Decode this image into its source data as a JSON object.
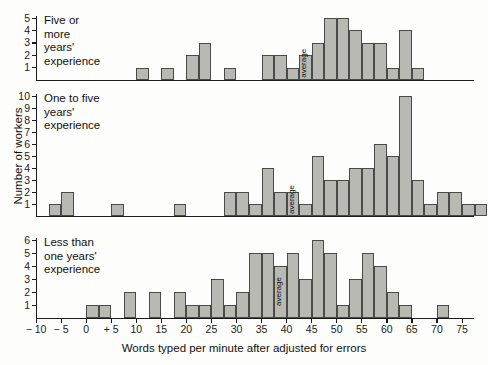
{
  "chart_data": {
    "type": "bar",
    "title": "",
    "xlabel": "Words typed per minute after adjusted for errors",
    "ylabel": "Number of workers",
    "xlim": [
      -10,
      77.5
    ],
    "bin_width": 2.5,
    "xticks": [
      -10,
      -5,
      0,
      5,
      10,
      15,
      20,
      25,
      30,
      35,
      40,
      45,
      50,
      55,
      60,
      65,
      70,
      75
    ],
    "xtick_labels": [
      "− 10",
      "− 5",
      "0",
      "+ 5",
      "10",
      "15",
      "20",
      "25",
      "30",
      "35",
      "40",
      "45",
      "50",
      "55",
      "60",
      "65",
      "70",
      "75"
    ],
    "grid": false,
    "legend": "none",
    "panels": [
      {
        "name": "five-or-more-years",
        "title": "Five or more years' experience",
        "ylim": [
          0,
          5
        ],
        "yticks": [
          1,
          2,
          3,
          4,
          5
        ],
        "average_label": "average",
        "average_bin_start": 42.5,
        "bins": [
          {
            "x0": 10.0,
            "value": 1
          },
          {
            "x0": 15.0,
            "value": 1
          },
          {
            "x0": 20.0,
            "value": 2
          },
          {
            "x0": 22.5,
            "value": 3
          },
          {
            "x0": 27.5,
            "value": 1
          },
          {
            "x0": 35.0,
            "value": 2
          },
          {
            "x0": 37.5,
            "value": 2
          },
          {
            "x0": 40.0,
            "value": 1
          },
          {
            "x0": 42.5,
            "value": 2
          },
          {
            "x0": 45.0,
            "value": 3
          },
          {
            "x0": 47.5,
            "value": 5
          },
          {
            "x0": 50.0,
            "value": 5
          },
          {
            "x0": 52.5,
            "value": 4
          },
          {
            "x0": 55.0,
            "value": 3
          },
          {
            "x0": 57.5,
            "value": 3
          },
          {
            "x0": 60.0,
            "value": 1
          },
          {
            "x0": 62.5,
            "value": 4
          },
          {
            "x0": 65.0,
            "value": 1
          }
        ]
      },
      {
        "name": "one-to-five-years",
        "title": "One to five years' experience",
        "ylim": [
          0,
          10
        ],
        "yticks": [
          1,
          2,
          3,
          4,
          5,
          6,
          7,
          8,
          9,
          10
        ],
        "average_label": "average",
        "average_bin_start": 40.0,
        "bins": [
          {
            "x0": -7.5,
            "value": 1
          },
          {
            "x0": -5.0,
            "value": 2
          },
          {
            "x0": 5.0,
            "value": 1
          },
          {
            "x0": 17.5,
            "value": 1
          },
          {
            "x0": 27.5,
            "value": 2
          },
          {
            "x0": 30.0,
            "value": 2
          },
          {
            "x0": 32.5,
            "value": 1
          },
          {
            "x0": 35.0,
            "value": 4
          },
          {
            "x0": 37.5,
            "value": 2
          },
          {
            "x0": 40.0,
            "value": 2
          },
          {
            "x0": 42.5,
            "value": 1
          },
          {
            "x0": 45.0,
            "value": 5
          },
          {
            "x0": 47.5,
            "value": 3
          },
          {
            "x0": 50.0,
            "value": 3
          },
          {
            "x0": 52.5,
            "value": 4
          },
          {
            "x0": 55.0,
            "value": 4
          },
          {
            "x0": 57.5,
            "value": 6
          },
          {
            "x0": 60.0,
            "value": 5
          },
          {
            "x0": 62.5,
            "value": 10
          },
          {
            "x0": 65.0,
            "value": 3
          },
          {
            "x0": 67.5,
            "value": 1
          },
          {
            "x0": 70.0,
            "value": 2
          },
          {
            "x0": 72.5,
            "value": 2
          },
          {
            "x0": 75.0,
            "value": 1
          },
          {
            "x0": 77.5,
            "value": 1
          },
          {
            "x0": 82.5,
            "value": 1
          }
        ]
      },
      {
        "name": "less-than-one-year",
        "title": "Less than one years'\n    experience",
        "ylim": [
          0,
          6
        ],
        "yticks": [
          1,
          2,
          3,
          4,
          5,
          6
        ],
        "average_label": "average",
        "average_bin_start": 37.5,
        "bins": [
          {
            "x0": 0.0,
            "value": 1
          },
          {
            "x0": 2.5,
            "value": 1
          },
          {
            "x0": 7.5,
            "value": 2
          },
          {
            "x0": 12.5,
            "value": 2
          },
          {
            "x0": 17.5,
            "value": 2
          },
          {
            "x0": 20.0,
            "value": 1
          },
          {
            "x0": 22.5,
            "value": 1
          },
          {
            "x0": 25.0,
            "value": 3
          },
          {
            "x0": 27.5,
            "value": 1
          },
          {
            "x0": 30.0,
            "value": 2
          },
          {
            "x0": 32.5,
            "value": 5
          },
          {
            "x0": 35.0,
            "value": 5
          },
          {
            "x0": 37.5,
            "value": 4
          },
          {
            "x0": 40.0,
            "value": 5
          },
          {
            "x0": 42.5,
            "value": 3
          },
          {
            "x0": 45.0,
            "value": 6
          },
          {
            "x0": 47.5,
            "value": 5
          },
          {
            "x0": 50.0,
            "value": 1
          },
          {
            "x0": 52.5,
            "value": 3
          },
          {
            "x0": 55.0,
            "value": 5
          },
          {
            "x0": 57.5,
            "value": 4
          },
          {
            "x0": 60.0,
            "value": 2
          },
          {
            "x0": 62.5,
            "value": 1
          },
          {
            "x0": 70.0,
            "value": 1
          }
        ]
      }
    ]
  }
}
